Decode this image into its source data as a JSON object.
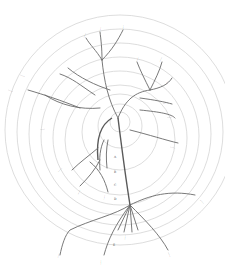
{
  "diagram": {
    "type": "circular phylogenetic tree (scanned figure)",
    "colors": {
      "background": "#ffffff",
      "rings": "#cfcfcf",
      "branches": "#6a6a6a",
      "text": "#3a3a3a"
    },
    "rings": {
      "center": [
        120,
        130
      ],
      "count": 9
    },
    "note": "Leaf labels are handwritten/printed too small to be legible at this resolution",
    "labels": {
      "l1": "……",
      "l2": "……",
      "l3": "……",
      "l4": "……",
      "l5": "……",
      "l6": "……",
      "l7": "……",
      "l8": "……",
      "l9": "……",
      "l10": "……",
      "l11": "……",
      "l12": "……",
      "l13": "……",
      "l14": "……",
      "l15": "……",
      "l16": "……",
      "l17": "……",
      "l18": "……",
      "l19": "……",
      "l20": "……"
    },
    "trunk_marks": {
      "m1": "A",
      "m2": "B",
      "m3": "C",
      "m4": "D",
      "m5": "E"
    }
  }
}
